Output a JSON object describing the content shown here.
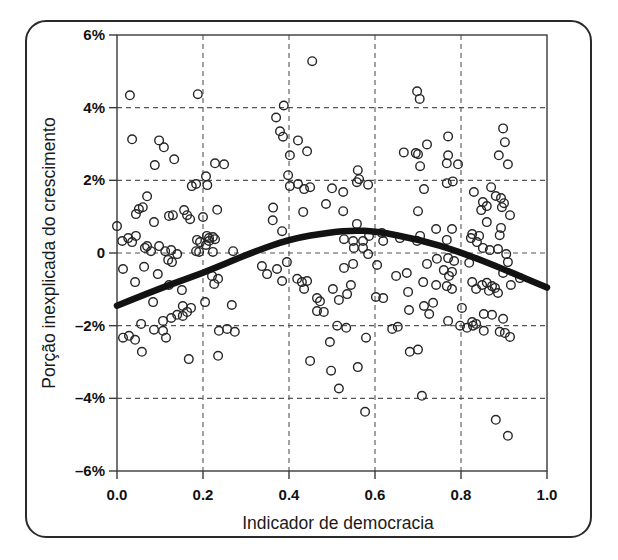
{
  "figure": {
    "kind": "framed statistical figure",
    "background": "#ffffff",
    "frame_color": "#2a2a2a"
  },
  "colors": {
    "axis": "#3a3a3a",
    "grid": "#555555",
    "marker_stroke": "#262626",
    "trend": "#121212",
    "text": "#1a1a1a"
  },
  "chart_data": {
    "type": "scatter",
    "title": "",
    "xlabel": "Indicador de democracia",
    "ylabel": "Porção inexplicada do crescimento",
    "xlim": [
      0,
      1
    ],
    "ylim": [
      -6,
      6
    ],
    "grid": "dashed",
    "legend": "none",
    "marker": "open-circle",
    "x_ticks": [
      {
        "v": 0.0,
        "label": "0.0"
      },
      {
        "v": 0.2,
        "label": "0.2"
      },
      {
        "v": 0.4,
        "label": "0.4"
      },
      {
        "v": 0.6,
        "label": "0.6"
      },
      {
        "v": 0.8,
        "label": "0.8"
      },
      {
        "v": 1.0,
        "label": "1.0"
      }
    ],
    "y_ticks": [
      {
        "v": 6,
        "label": "6%"
      },
      {
        "v": 4,
        "label": "4%"
      },
      {
        "v": 2,
        "label": "2%"
      },
      {
        "v": 0,
        "label": "0"
      },
      {
        "v": -2,
        "label": "–2%"
      },
      {
        "v": -4,
        "label": "–4%"
      },
      {
        "v": -6,
        "label": "–6%"
      }
    ],
    "trend_line": {
      "label": "fitted quadratic (inverted-U)",
      "peak": {
        "x": 0.55,
        "y": 0.62
      },
      "points": [
        [
          0.0,
          -1.45
        ],
        [
          0.1,
          -0.97
        ],
        [
          0.2,
          -0.55
        ],
        [
          0.3,
          -0.05
        ],
        [
          0.4,
          0.38
        ],
        [
          0.5,
          0.58
        ],
        [
          0.55,
          0.62
        ],
        [
          0.6,
          0.6
        ],
        [
          0.7,
          0.38
        ],
        [
          0.8,
          0.02
        ],
        [
          0.9,
          -0.45
        ],
        [
          1.0,
          -0.95
        ]
      ]
    },
    "points": [
      [
        0.03,
        4.34
      ],
      [
        0.188,
        4.37
      ],
      [
        0.388,
        4.06
      ],
      [
        0.454,
        5.28
      ],
      [
        0.698,
        4.45
      ],
      [
        0.704,
        4.24
      ],
      [
        0.898,
        3.43
      ],
      [
        0.902,
        3.05
      ],
      [
        0.888,
        2.69
      ],
      [
        0.909,
        2.44
      ],
      [
        0.77,
        3.21
      ],
      [
        0.721,
        2.99
      ],
      [
        0.7,
        2.72
      ],
      [
        0.705,
        2.39
      ],
      [
        0.667,
        2.77
      ],
      [
        0.695,
        2.75
      ],
      [
        0.37,
        3.73
      ],
      [
        0.379,
        3.35
      ],
      [
        0.386,
        3.2
      ],
      [
        0.421,
        3.1
      ],
      [
        0.442,
        2.8
      ],
      [
        0.402,
        2.69
      ],
      [
        0.398,
        2.14
      ],
      [
        0.56,
        2.28
      ],
      [
        0.563,
        2.03
      ],
      [
        0.035,
        3.13
      ],
      [
        0.098,
        3.1
      ],
      [
        0.109,
        2.91
      ],
      [
        0.133,
        2.58
      ],
      [
        0.088,
        2.42
      ],
      [
        0.228,
        2.47
      ],
      [
        0.249,
        2.44
      ],
      [
        0.174,
        1.84
      ],
      [
        0.184,
        1.9
      ],
      [
        0.207,
        2.11
      ],
      [
        0.21,
        1.87
      ],
      [
        0.77,
        2.69
      ],
      [
        0.767,
        2.47
      ],
      [
        0.793,
        2.44
      ],
      [
        0.83,
        1.68
      ],
      [
        0.87,
        1.81
      ],
      [
        0.881,
        1.57
      ],
      [
        0.851,
        1.4
      ],
      [
        0.86,
        1.29
      ],
      [
        0.847,
        1.18
      ],
      [
        0.893,
        1.51
      ],
      [
        0.9,
        1.37
      ],
      [
        0.895,
        1.26
      ],
      [
        0.914,
        1.04
      ],
      [
        0.86,
        0.85
      ],
      [
        0.767,
        1.92
      ],
      [
        0.781,
        1.97
      ],
      [
        0.421,
        1.9
      ],
      [
        0.449,
        1.81
      ],
      [
        0.5,
        1.78
      ],
      [
        0.435,
        1.76
      ],
      [
        0.402,
        1.84
      ],
      [
        0.558,
        1.95
      ],
      [
        0.584,
        1.88
      ],
      [
        0.714,
        1.76
      ],
      [
        0.526,
        1.68
      ],
      [
        0.486,
        1.35
      ],
      [
        0.433,
        1.13
      ],
      [
        0.363,
        1.25
      ],
      [
        0.362,
        0.9
      ],
      [
        0.384,
        0.6
      ],
      [
        0.526,
        1.15
      ],
      [
        0.558,
        0.8
      ],
      [
        0.616,
        0.55
      ],
      [
        0.619,
        0.33
      ],
      [
        0.658,
        0.41
      ],
      [
        0.7,
        1.15
      ],
      [
        0.705,
        0.47
      ],
      [
        0.742,
        0.66
      ],
      [
        0.779,
        0.66
      ],
      [
        0.767,
        0.36
      ],
      [
        0.698,
        0.33
      ],
      [
        0.826,
        0.52
      ],
      [
        0.842,
        0.47
      ],
      [
        0.89,
        0.49
      ],
      [
        0.893,
        0.69
      ],
      [
        0.823,
        0.41
      ],
      [
        0.837,
        0.3
      ],
      [
        0.851,
        0.14
      ],
      [
        0.867,
        0.08
      ],
      [
        0.886,
        0.11
      ],
      [
        0.905,
        -0.03
      ],
      [
        0.909,
        -0.25
      ],
      [
        0.898,
        -0.55
      ],
      [
        0.937,
        -0.69
      ],
      [
        0.886,
        -1.1
      ],
      [
        0.916,
        -0.88
      ],
      [
        0.914,
        -2.31
      ],
      [
        0.051,
        1.21
      ],
      [
        0.06,
        1.26
      ],
      [
        0.044,
        1.07
      ],
      [
        0.086,
        0.85
      ],
      [
        0.121,
        1.02
      ],
      [
        0.13,
        1.04
      ],
      [
        0.156,
        1.18
      ],
      [
        0.163,
        1.04
      ],
      [
        0.2,
        0.99
      ],
      [
        0.233,
        1.19
      ],
      [
        0.07,
        1.56
      ],
      [
        0.17,
        0.93
      ],
      [
        0.012,
        0.33
      ],
      [
        0.035,
        0.3
      ],
      [
        0.065,
        0.14
      ],
      [
        0.079,
        0.05
      ],
      [
        0.098,
        0.19
      ],
      [
        0.112,
        0.05
      ],
      [
        0.186,
        0.36
      ],
      [
        0.193,
        0.3
      ],
      [
        0.184,
        0.05
      ],
      [
        0.191,
        0.03
      ],
      [
        0.209,
        0.47
      ],
      [
        0.228,
        0.38
      ],
      [
        0.0,
        0.74
      ],
      [
        0.026,
        0.41
      ],
      [
        0.044,
        0.47
      ],
      [
        0.07,
        0.19
      ],
      [
        0.126,
        0.08
      ],
      [
        0.14,
        -0.03
      ],
      [
        0.119,
        -0.19
      ],
      [
        0.128,
        -0.25
      ],
      [
        0.014,
        -0.44
      ],
      [
        0.042,
        -0.8
      ],
      [
        0.063,
        -0.38
      ],
      [
        0.095,
        -0.58
      ],
      [
        0.121,
        -0.88
      ],
      [
        0.151,
        -1.02
      ],
      [
        0.214,
        0.33
      ],
      [
        0.223,
        0.44
      ],
      [
        0.205,
        -1.35
      ],
      [
        0.267,
        -1.43
      ],
      [
        0.221,
        -0.63
      ],
      [
        0.235,
        -0.71
      ],
      [
        0.226,
        -0.85
      ],
      [
        0.27,
        0.05
      ],
      [
        0.223,
        0.03
      ],
      [
        0.207,
        0.22
      ],
      [
        0.214,
        0.41
      ],
      [
        0.084,
        -1.35
      ],
      [
        0.153,
        -1.46
      ],
      [
        0.14,
        -1.7
      ],
      [
        0.153,
        -1.73
      ],
      [
        0.163,
        -1.62
      ],
      [
        0.056,
        -1.95
      ],
      [
        0.114,
        -2.33
      ],
      [
        0.028,
        -2.28
      ],
      [
        0.014,
        -2.33
      ],
      [
        0.042,
        -2.39
      ],
      [
        0.107,
        -1.87
      ],
      [
        0.126,
        -1.79
      ],
      [
        0.086,
        -2.11
      ],
      [
        0.107,
        -2.14
      ],
      [
        0.172,
        -1.51
      ],
      [
        0.058,
        -2.72
      ],
      [
        0.167,
        -2.92
      ],
      [
        0.235,
        -2.83
      ],
      [
        0.237,
        -2.14
      ],
      [
        0.256,
        -2.09
      ],
      [
        0.274,
        -2.17
      ],
      [
        0.337,
        -0.36
      ],
      [
        0.349,
        -0.58
      ],
      [
        0.372,
        -0.44
      ],
      [
        0.395,
        -0.25
      ],
      [
        0.384,
        -0.77
      ],
      [
        0.419,
        -0.71
      ],
      [
        0.43,
        -0.8
      ],
      [
        0.442,
        -0.77
      ],
      [
        0.435,
        -0.99
      ],
      [
        0.465,
        -1.24
      ],
      [
        0.472,
        -1.33
      ],
      [
        0.502,
        -0.99
      ],
      [
        0.535,
        -1.13
      ],
      [
        0.528,
        -0.41
      ],
      [
        0.549,
        -0.3
      ],
      [
        0.551,
        0.14
      ],
      [
        0.572,
        0.14
      ],
      [
        0.584,
        -0.03
      ],
      [
        0.528,
        0.38
      ],
      [
        0.549,
        0.33
      ],
      [
        0.572,
        0.33
      ],
      [
        0.586,
        0.47
      ],
      [
        0.605,
        -0.33
      ],
      [
        0.649,
        -0.63
      ],
      [
        0.674,
        -0.55
      ],
      [
        0.721,
        -0.3
      ],
      [
        0.744,
        -0.16
      ],
      [
        0.77,
        -0.14
      ],
      [
        0.784,
        -0.22
      ],
      [
        0.819,
        -0.27
      ],
      [
        0.76,
        -0.47
      ],
      [
        0.779,
        -0.52
      ],
      [
        0.772,
        -0.63
      ],
      [
        0.767,
        -0.91
      ],
      [
        0.779,
        -0.99
      ],
      [
        0.735,
        -1.37
      ],
      [
        0.544,
        -0.88
      ],
      [
        0.712,
        -0.8
      ],
      [
        0.742,
        -0.88
      ],
      [
        0.826,
        -0.8
      ],
      [
        0.865,
        -1.04
      ],
      [
        0.879,
        -0.96
      ],
      [
        0.677,
        -1.07
      ],
      [
        0.602,
        -1.21
      ],
      [
        0.619,
        -1.24
      ],
      [
        0.516,
        -1.29
      ],
      [
        0.714,
        -1.46
      ],
      [
        0.679,
        -1.57
      ],
      [
        0.726,
        -1.68
      ],
      [
        0.802,
        -1.51
      ],
      [
        0.826,
        -1.9
      ],
      [
        0.835,
        -1.95
      ],
      [
        0.853,
        -1.68
      ],
      [
        0.872,
        -1.7
      ],
      [
        0.898,
        -1.81
      ],
      [
        0.77,
        -1.87
      ],
      [
        0.465,
        -1.6
      ],
      [
        0.481,
        -1.62
      ],
      [
        0.849,
        -0.88
      ],
      [
        0.86,
        -0.82
      ],
      [
        0.872,
        -0.91
      ],
      [
        0.835,
        -0.99
      ],
      [
        0.512,
        -2.0
      ],
      [
        0.533,
        -2.06
      ],
      [
        0.64,
        -2.09
      ],
      [
        0.653,
        -2.03
      ],
      [
        0.798,
        -2.0
      ],
      [
        0.814,
        -2.06
      ],
      [
        0.828,
        -2.0
      ],
      [
        0.853,
        -2.14
      ],
      [
        0.89,
        -2.17
      ],
      [
        0.902,
        -2.2
      ],
      [
        0.681,
        -2.72
      ],
      [
        0.7,
        -2.66
      ],
      [
        0.495,
        -2.45
      ],
      [
        0.579,
        -2.33
      ],
      [
        0.449,
        -2.97
      ],
      [
        0.498,
        -3.24
      ],
      [
        0.56,
        -3.14
      ],
      [
        0.516,
        -3.73
      ],
      [
        0.709,
        -3.93
      ],
      [
        0.577,
        -4.37
      ],
      [
        0.881,
        -4.59
      ],
      [
        0.909,
        -5.03
      ]
    ]
  }
}
